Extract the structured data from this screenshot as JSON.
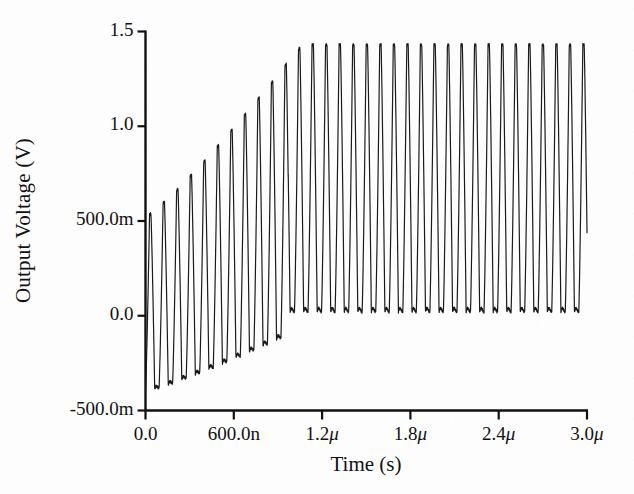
{
  "chart_data": {
    "type": "line",
    "title": "",
    "xlabel": "Time (s)",
    "ylabel": "Output Voltage (V)",
    "xlim": [
      0,
      3e-06
    ],
    "ylim": [
      -0.5,
      1.5
    ],
    "grid": false,
    "legend": null,
    "xticks": [
      {
        "value": 0.0,
        "label": "0.0"
      },
      {
        "value": 6e-07,
        "label": "600.0n"
      },
      {
        "value": 1.2e-06,
        "label": "1.2μ"
      },
      {
        "value": 1.8e-06,
        "label": "1.8μ"
      },
      {
        "value": 2.4e-06,
        "label": "2.4μ"
      },
      {
        "value": 3e-06,
        "label": "3.0μ"
      }
    ],
    "yticks": [
      {
        "value": 1.5,
        "label": "1.5"
      },
      {
        "value": 1.0,
        "label": "1.0"
      },
      {
        "value": 0.5,
        "label": "500.0m"
      },
      {
        "value": 0.0,
        "label": "0.0"
      },
      {
        "value": -0.5,
        "label": "-500.0m"
      }
    ],
    "series": [
      {
        "name": "Output Voltage",
        "color": "#1a1a1a",
        "linewidth": 1.2,
        "description": "Ring-oscillator style startup: oscillation amplitude grows from t=0 until the loop saturates near t=0.97 microseconds, after which a steady-state rail-to-rail waveform of constant amplitude continues to t=3.0 microseconds.",
        "waveform": {
          "period_s": 9.2e-08,
          "startup": {
            "t_start_s": 0.0,
            "t_end_s": 9.7e-07,
            "center_start_v": 0.06,
            "center_end_v": 0.62,
            "amplitude_start_v": 0.46,
            "amplitude_end_v": 0.72,
            "peak_first_v": 0.5,
            "trough_first_v": -0.4
          },
          "steady_state": {
            "t_start_s": 9.7e-07,
            "t_end_s": 3e-06,
            "peak_v": 1.43,
            "trough_v": 0.02,
            "first_peak_v": 1.33,
            "duty_shape": "narrow positive spikes with flat-ish lower excursions"
          }
        },
        "sample_peaks_v": [
          0.5,
          0.52,
          0.55,
          0.58,
          0.61,
          0.64,
          0.67,
          0.7,
          0.73,
          0.77,
          0.82,
          1.33,
          1.43,
          1.43,
          1.43,
          1.43,
          1.43
        ],
        "sample_troughs_v": [
          -0.4,
          -0.34,
          -0.29,
          -0.24,
          -0.19,
          -0.14,
          -0.09,
          -0.04,
          0.01,
          0.05,
          0.02,
          0.02,
          0.02,
          0.02,
          0.02
        ]
      }
    ]
  },
  "axes": {
    "spine_color": "#111111",
    "background": "#fdfdfd"
  }
}
